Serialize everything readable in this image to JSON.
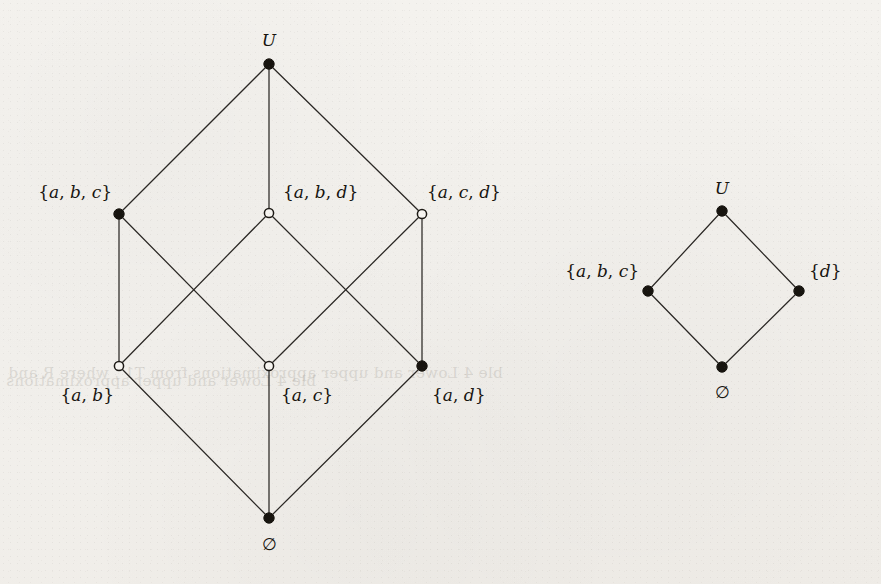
{
  "figure": {
    "background_color": "#f4f2ee",
    "ink_color": "#17140f",
    "open_node_fill": "#f6f4f0"
  },
  "diagrams": [
    {
      "id": "left-lattice",
      "name": "subset-lattice-of-U",
      "nodes": [
        {
          "id": "top",
          "label": "U",
          "label_plain": "U",
          "style": "filled",
          "x": 269,
          "y": 64,
          "label_x": 269,
          "label_y": 46,
          "label_anchor": "middle"
        },
        {
          "id": "abc",
          "label": "{a, b, c}",
          "label_plain": "{a,b,c}",
          "style": "filled",
          "x": 119,
          "y": 214,
          "label_x": 112,
          "label_y": 198,
          "label_anchor": "end"
        },
        {
          "id": "abd",
          "label": "{a, b, d}",
          "label_plain": "{a,b,d}",
          "style": "open",
          "x": 269,
          "y": 213,
          "label_x": 283,
          "label_y": 198,
          "label_anchor": "start"
        },
        {
          "id": "acd",
          "label": "{a, c, d}",
          "label_plain": "{a,c,d}",
          "style": "open",
          "x": 422,
          "y": 214,
          "label_x": 427,
          "label_y": 198,
          "label_anchor": "start"
        },
        {
          "id": "ab",
          "label": "{a, b}",
          "label_plain": "{a,b}",
          "style": "open",
          "x": 119,
          "y": 366,
          "label_x": 114,
          "label_y": 401,
          "label_anchor": "end"
        },
        {
          "id": "ac",
          "label": "{a, c}",
          "label_plain": "{a,c}",
          "style": "open",
          "x": 269,
          "y": 366,
          "label_x": 281,
          "label_y": 401,
          "label_anchor": "start"
        },
        {
          "id": "ad",
          "label": "{a, d}",
          "label_plain": "{a,d}",
          "style": "filled",
          "x": 422,
          "y": 366,
          "label_x": 432,
          "label_y": 401,
          "label_anchor": "start"
        },
        {
          "id": "empty",
          "label": "∅",
          "label_plain": "empty-set",
          "style": "filled",
          "x": 269,
          "y": 518,
          "label_x": 269,
          "label_y": 550,
          "label_anchor": "middle"
        }
      ],
      "edges": [
        {
          "from": "top",
          "to": "abc"
        },
        {
          "from": "top",
          "to": "abd"
        },
        {
          "from": "top",
          "to": "acd"
        },
        {
          "from": "abc",
          "to": "ab"
        },
        {
          "from": "abc",
          "to": "ac"
        },
        {
          "from": "abd",
          "to": "ab"
        },
        {
          "from": "abd",
          "to": "ad"
        },
        {
          "from": "acd",
          "to": "ac"
        },
        {
          "from": "acd",
          "to": "ad"
        },
        {
          "from": "ab",
          "to": "empty"
        },
        {
          "from": "ac",
          "to": "empty"
        },
        {
          "from": "ad",
          "to": "empty"
        }
      ]
    },
    {
      "id": "right-lattice",
      "name": "quotient-lattice",
      "nodes": [
        {
          "id": "r-top",
          "label": "U",
          "label_plain": "U",
          "style": "filled",
          "x": 722,
          "y": 211,
          "label_x": 722,
          "label_y": 194,
          "label_anchor": "middle"
        },
        {
          "id": "r-abc",
          "label": "{a, b, c}",
          "label_plain": "{a,b,c}",
          "style": "filled",
          "x": 648,
          "y": 291,
          "label_x": 639,
          "label_y": 277,
          "label_anchor": "end"
        },
        {
          "id": "r-d",
          "label": "{d}",
          "label_plain": "{d}",
          "style": "filled",
          "x": 799,
          "y": 291,
          "label_x": 809,
          "label_y": 277,
          "label_anchor": "start"
        },
        {
          "id": "r-empty",
          "label": "∅",
          "label_plain": "empty-set",
          "style": "filled",
          "x": 722,
          "y": 367,
          "label_x": 722,
          "label_y": 398,
          "label_anchor": "middle"
        }
      ],
      "edges": [
        {
          "from": "r-top",
          "to": "r-abc"
        },
        {
          "from": "r-top",
          "to": "r-d"
        },
        {
          "from": "r-abc",
          "to": "r-empty"
        },
        {
          "from": "r-d",
          "to": "r-empty"
        }
      ]
    }
  ],
  "ghost_text": [
    {
      "text": "ble 4 Lower and upper approximations from T1 , where R and",
      "x": 8,
      "y": 364,
      "size": 15
    },
    {
      "text": "ble 4 Lower and upper approximations",
      "x": 6,
      "y": 372,
      "size": 15
    }
  ]
}
